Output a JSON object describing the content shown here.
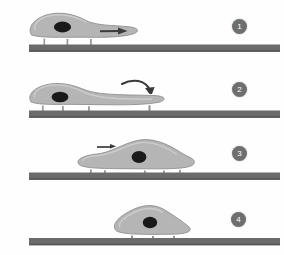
{
  "figure": {
    "background_color": "#fefefe",
    "panel_count": 4
  },
  "style": {
    "cell_fill": "#b3b3b3",
    "cell_fill_light": "#c4c4c4",
    "cell_membrane_outline": "#ffffff",
    "cell_edge_stroke": "#8a8a8a",
    "nucleus_color": "#1a1a1a",
    "substrate_color": "#6b6b6b",
    "substrate_shadow": "#4f4f4f",
    "adhesion_foot_color": "#9a9a9a",
    "arrow_color": "#3a3a3a",
    "badge_fill": "#6e6e6e",
    "badge_text_color": "#ffffff"
  },
  "panels": [
    {
      "number": "1",
      "badge_label": "1",
      "stage_name": "protrusion-extension",
      "cell_shape": "elongated-with-thin-trailing-tail",
      "arrow": {
        "type": "straight-right-inside-tail",
        "label": ""
      },
      "adhesion_feet": 3,
      "nucleus": {
        "position": "rear",
        "shape": "ellipse"
      }
    },
    {
      "number": "2",
      "badge_label": "2",
      "stage_name": "tail-retraction",
      "cell_shape": "flattened-elongated-tapered-tail",
      "arrow": {
        "type": "curved-down-right",
        "label": ""
      },
      "adhesion_feet": 4,
      "nucleus": {
        "position": "rear",
        "shape": "ellipse"
      }
    },
    {
      "number": "3",
      "badge_label": "3",
      "stage_name": "cell-body-translocation",
      "cell_shape": "broad-mound-shifted-forward",
      "arrow": {
        "type": "straight-right",
        "label": ""
      },
      "adhesion_feet": 5,
      "nucleus": {
        "position": "center",
        "shape": "circle"
      }
    },
    {
      "number": "4",
      "badge_label": "4",
      "stage_name": "rounded-compact-cell",
      "cell_shape": "compact-dome",
      "arrow": null,
      "adhesion_feet": 3,
      "nucleus": {
        "position": "center",
        "shape": "circle"
      }
    }
  ]
}
